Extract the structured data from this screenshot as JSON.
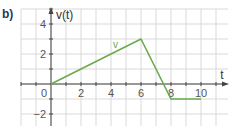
{
  "figure_label": "b)",
  "colors": {
    "grid": "#d9d9d9",
    "axis": "#444444",
    "line": "#6aaa4a",
    "label": "#1b3a5a"
  },
  "chart_data": {
    "type": "line",
    "title": "",
    "xlabel": "t",
    "ylabel": "v(t)",
    "xlim": [
      -2,
      11
    ],
    "ylim": [
      -2.5,
      4.8
    ],
    "grid": true,
    "x_ticks": [
      0,
      2,
      4,
      6,
      8,
      10
    ],
    "x_tick_labels": [
      "0",
      "2",
      "4",
      "6",
      "8",
      "10"
    ],
    "y_ticks": [
      4,
      2,
      -2
    ],
    "y_tick_labels": [
      "4",
      "2",
      "-2"
    ],
    "series": [
      {
        "name": "v",
        "x": [
          0,
          6,
          8,
          10
        ],
        "y": [
          0,
          3,
          -1,
          -1
        ]
      }
    ],
    "annotations": [
      {
        "text": "v",
        "x": 4.3,
        "y": 2.4
      }
    ]
  }
}
